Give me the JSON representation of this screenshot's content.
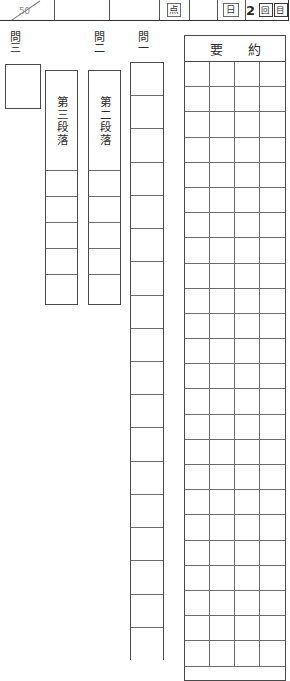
{
  "sheet": {
    "title": "国語 記述式解答用紙",
    "orientation": "vertical-japanese"
  },
  "header": {
    "score_denominator": "50",
    "score_value": "",
    "blank_cell_1": "",
    "blank_cell_2": "",
    "points_label": "点",
    "blank_cell_3": "",
    "day_label": "日",
    "attempt_number": "2",
    "attempt_label": "回目",
    "attempt_full": "2回目"
  },
  "questions": {
    "q3": {
      "label": "問三",
      "answer_value": ""
    },
    "q2": {
      "label": "問二",
      "paragraph_label": "第二段落",
      "cells": [
        "",
        "",
        "",
        "",
        ""
      ]
    },
    "q2b": {
      "paragraph_label": "第三段落",
      "cells": [
        "",
        "",
        "",
        "",
        ""
      ]
    },
    "q1": {
      "label": "問一",
      "cells": [
        "",
        "",
        "",
        "",
        "",
        "",
        "",
        "",
        "",
        "",
        "",
        "",
        "",
        "",
        "",
        "",
        "",
        ""
      ]
    }
  },
  "summary": {
    "title": "要　約",
    "columns": 4,
    "rows": 24,
    "cells": []
  },
  "colors": {
    "ink": "#2b2b2b",
    "rule_heavy": "#4a4a4a",
    "rule_light": "#6d6d6d",
    "paper": "#ffffff"
  }
}
